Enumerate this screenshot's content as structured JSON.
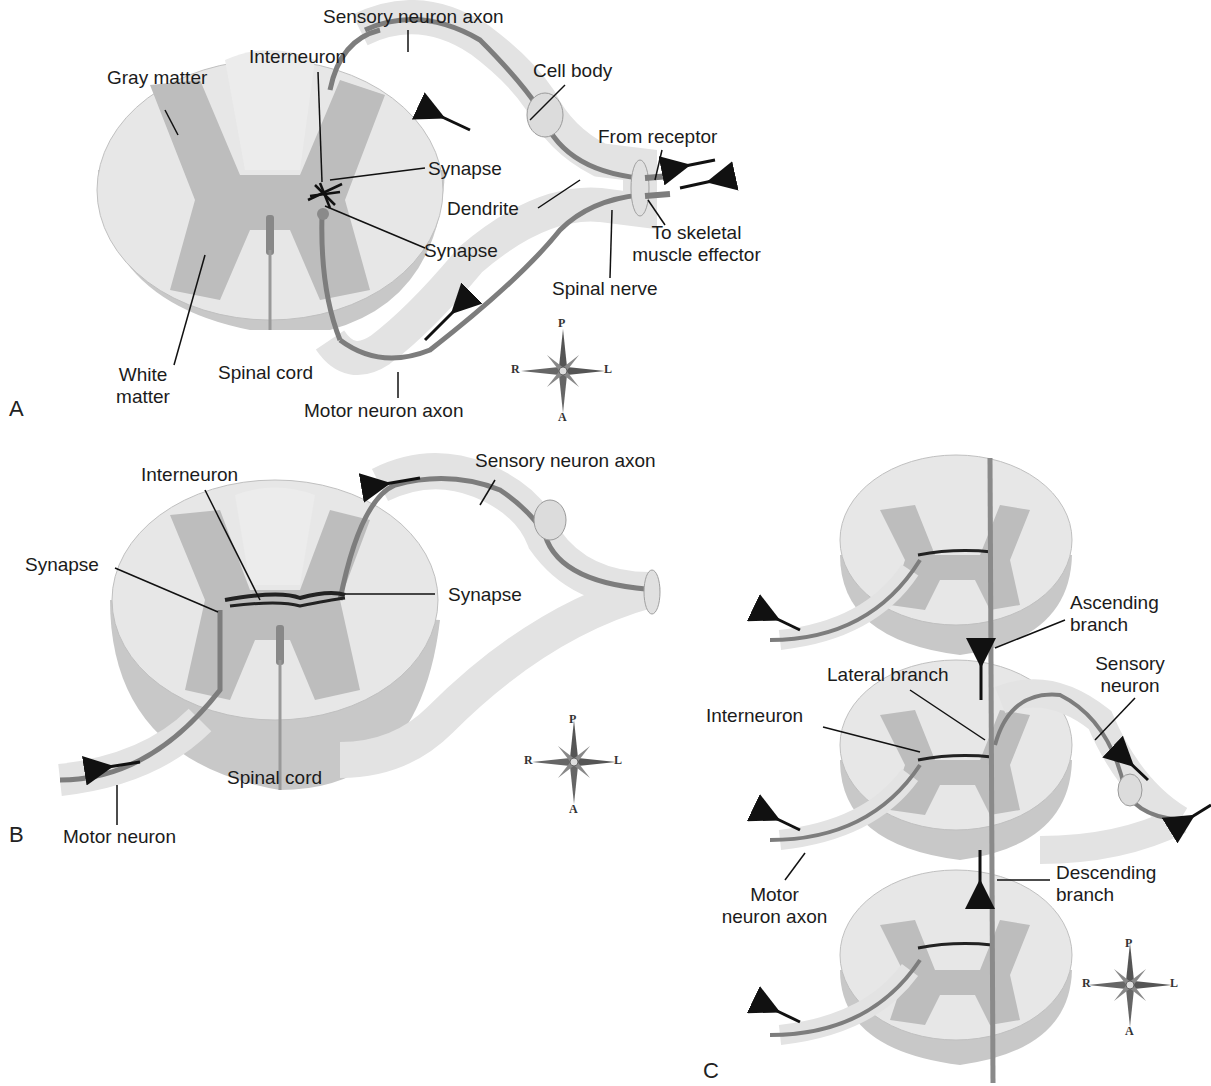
{
  "colors": {
    "white_matter": "#e6e6e6",
    "gray_matter": "#bdbdbd",
    "cord_side": "#c9c9c9",
    "nerve_sheath": "#e9e9e9",
    "neuron_fiber": "#7a7a7a",
    "interneuron": "#222222",
    "label_line": "#111111"
  },
  "panels": [
    {
      "id": "A",
      "letter": "A",
      "labels": {
        "sensory_neuron_axon": "Sensory neuron axon",
        "interneuron": "Interneuron",
        "gray_matter": "Gray matter",
        "cell_body": "Cell body",
        "from_receptor": "From receptor",
        "synapse_upper": "Synapse",
        "dendrite": "Dendrite",
        "to_skeletal_1": "To skeletal",
        "to_skeletal_2": "muscle effector",
        "synapse_lower": "Synapse",
        "spinal_nerve": "Spinal nerve",
        "white_matter_1": "White",
        "white_matter_2": "matter",
        "spinal_cord": "Spinal cord",
        "motor_neuron_axon": "Motor neuron axon"
      },
      "compass": {
        "top": "P",
        "bottom": "A",
        "left": "R",
        "right": "L"
      }
    },
    {
      "id": "B",
      "letter": "B",
      "labels": {
        "interneuron": "Interneuron",
        "sensory_neuron_axon": "Sensory neuron axon",
        "synapse_left": "Synapse",
        "synapse_right": "Synapse",
        "spinal_cord": "Spinal cord",
        "motor_neuron": "Motor neuron"
      },
      "compass": {
        "top": "P",
        "bottom": "A",
        "left": "R",
        "right": "L"
      }
    },
    {
      "id": "C",
      "letter": "C",
      "labels": {
        "ascending_1": "Ascending",
        "ascending_2": "branch",
        "lateral_branch": "Lateral branch",
        "sensory_1": "Sensory",
        "sensory_2": "neuron",
        "interneuron": "Interneuron",
        "motor_1": "Motor",
        "motor_2": "neuron axon",
        "descending_1": "Descending",
        "descending_2": "branch"
      },
      "compass": {
        "top": "P",
        "bottom": "A",
        "left": "R",
        "right": "L"
      }
    }
  ]
}
